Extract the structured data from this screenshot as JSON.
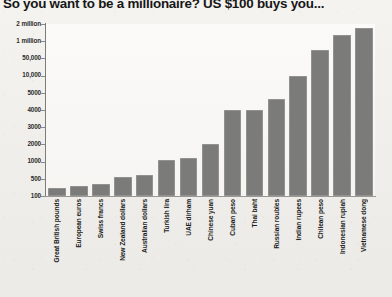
{
  "title": "So you want to be a millionaire? US $100 buys you...",
  "chart_data": {
    "type": "bar",
    "title": "So you want to be a millionaire? US $100 buys you...",
    "xlabel": "",
    "ylabel": "",
    "grid": true,
    "legend": "none",
    "y_scale": "ordinal (non-linear category axis)",
    "y_ticks": [
      "100",
      "500",
      "1000",
      "2000",
      "3000",
      "4000",
      "5000",
      "10,000",
      "50,000",
      "1 million",
      "2 million"
    ],
    "categories": [
      "Great British pounds",
      "European euros",
      "Swiss francs",
      "New Zealand dollars",
      "Australian dollars",
      "Turkish lira",
      "UAE dirham",
      "Chinese yuan",
      "Cuban peso",
      "Thai baht",
      "Russian roubles",
      "Indian rupees",
      "Chilean peso",
      "Indonesian rupiah",
      "Vietnamese dong"
    ],
    "values": [
      78,
      91,
      98,
      145,
      152,
      330,
      367,
      690,
      2400,
      2400,
      3300,
      6200,
      48000,
      1000000,
      1800000
    ],
    "value_labels": [
      "78",
      "91",
      "98",
      "145",
      "152",
      "330",
      "367",
      "690",
      "2400",
      "2400",
      "3300",
      "6200",
      "48,000",
      "1 million",
      "1.8 million"
    ],
    "bar_color": "#7b7b79",
    "plot_background": "#faf9f6",
    "page_background": "#f2f1ee",
    "bar_pixel_heights": [
      8,
      10,
      12,
      19,
      21,
      36,
      38,
      52,
      86,
      86,
      97,
      120,
      146,
      161,
      168
    ]
  }
}
